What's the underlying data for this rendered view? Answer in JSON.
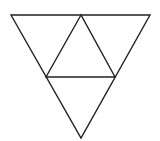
{
  "diagram": {
    "type": "subdivided-inverted-triangle",
    "stroke_color": "#222222",
    "background_color": "#ffffff",
    "outer_triangle": {
      "top_left": [
        11,
        15
      ],
      "top_right": [
        150,
        15
      ],
      "bottom": [
        81,
        138
      ]
    },
    "inner_triangle": {
      "top": [
        81,
        15
      ],
      "left": [
        46,
        77
      ],
      "right": [
        115,
        77
      ]
    },
    "sub_triangle_count": 4
  }
}
